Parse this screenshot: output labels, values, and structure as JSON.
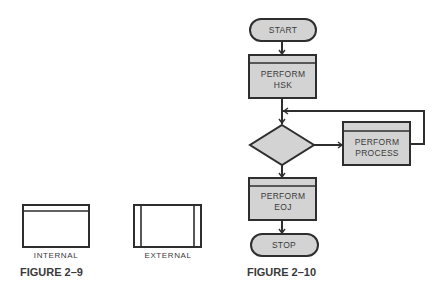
{
  "figure_2_9": {
    "caption": "FIGURE 2–9",
    "symbols": [
      {
        "name": "internal",
        "label": "INTERNAL"
      },
      {
        "name": "external",
        "label": "EXTERNAL"
      }
    ]
  },
  "figure_2_10": {
    "caption": "FIGURE 2–10",
    "nodes": {
      "start": {
        "type": "terminal",
        "label": "START"
      },
      "hsk": {
        "type": "predefined-process",
        "line1": "PERFORM",
        "line2": "HSK"
      },
      "decision": {
        "type": "decision",
        "label": ""
      },
      "process": {
        "type": "predefined-process",
        "line1": "PERFORM",
        "line2": "PROCESS"
      },
      "eoj": {
        "type": "predefined-process",
        "line1": "PERFORM",
        "line2": "EOJ"
      },
      "stop": {
        "type": "terminal",
        "label": "STOP"
      }
    },
    "edges": [
      {
        "from": "start",
        "to": "hsk"
      },
      {
        "from": "hsk",
        "to": "decision"
      },
      {
        "from": "decision",
        "to": "process"
      },
      {
        "from": "process",
        "to": "decision",
        "note": "loop back"
      },
      {
        "from": "decision",
        "to": "eoj"
      },
      {
        "from": "eoj",
        "to": "stop"
      }
    ]
  },
  "colors": {
    "fill": "#d3d3d3",
    "stroke": "#2e2e2e",
    "text": "#3a3a3a"
  }
}
